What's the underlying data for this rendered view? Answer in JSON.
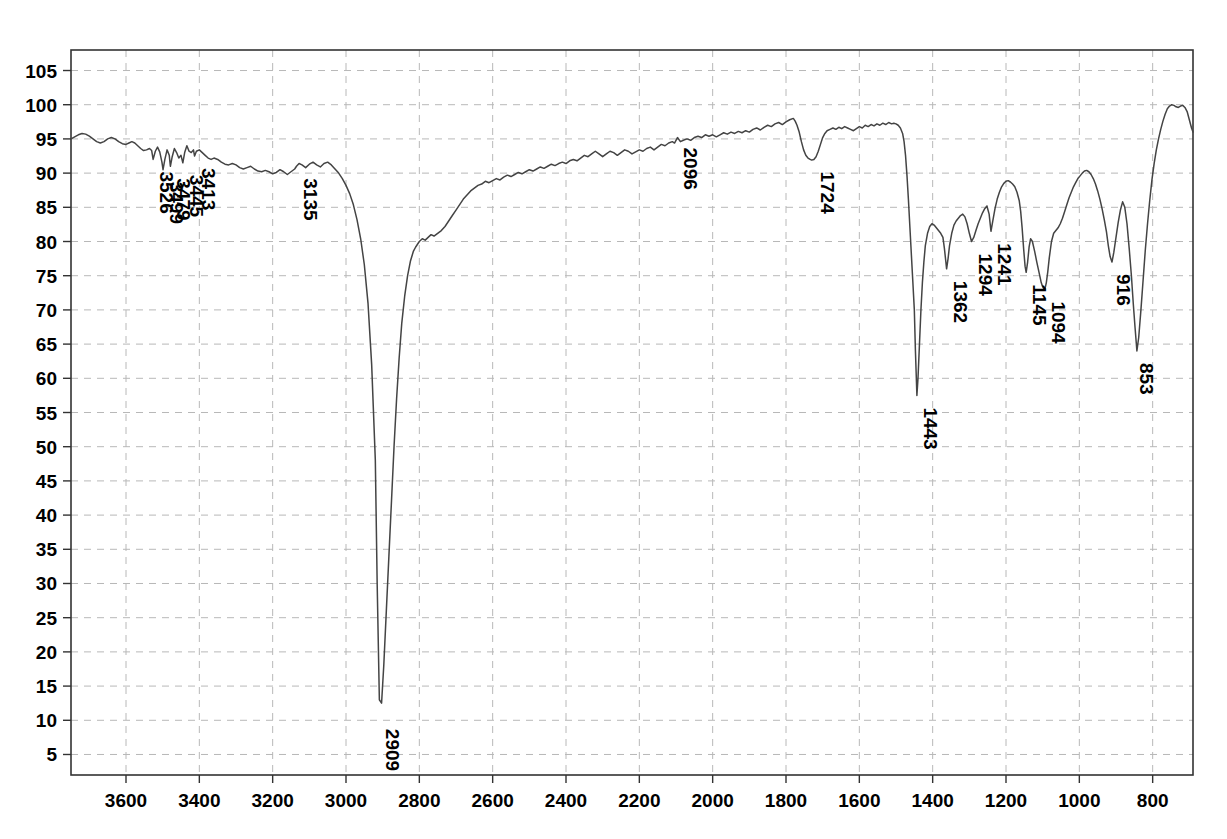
{
  "chart_data": {
    "type": "line",
    "title": "",
    "subtitle": "",
    "xlabel": "",
    "ylabel": "",
    "grid": true,
    "legend": "none",
    "x_axis": {
      "ticks": [
        3600,
        3400,
        3200,
        3000,
        2800,
        2600,
        2400,
        2200,
        2000,
        1800,
        1600,
        1400,
        1200,
        1000,
        800
      ],
      "min": 3750,
      "max": 690,
      "direction": "descending"
    },
    "y_axis": {
      "ticks": [
        5,
        10,
        15,
        20,
        25,
        30,
        35,
        40,
        45,
        50,
        55,
        60,
        65,
        70,
        75,
        80,
        85,
        90,
        95,
        100,
        105
      ],
      "min": 2,
      "max": 108
    },
    "line_color": "#444444",
    "grid_color": "#b8b8b8",
    "axis_color": "#333333",
    "annotations": [
      {
        "label": "3526",
        "x": 3526,
        "y": 92.0
      },
      {
        "label": "3499",
        "x": 3499,
        "y": 90.5
      },
      {
        "label": "3479",
        "x": 3479,
        "y": 91.0
      },
      {
        "label": "3445",
        "x": 3445,
        "y": 91.5
      },
      {
        "label": "3413",
        "x": 3413,
        "y": 92.5
      },
      {
        "label": "3135",
        "x": 3135,
        "y": 91.0
      },
      {
        "label": "2909",
        "x": 2909,
        "y": 10.5
      },
      {
        "label": "2096",
        "x": 2096,
        "y": 95.5
      },
      {
        "label": "1724",
        "x": 1724,
        "y": 92.0
      },
      {
        "label": "1443",
        "x": 1443,
        "y": 57.5
      },
      {
        "label": "1362",
        "x": 1362,
        "y": 76.0
      },
      {
        "label": "1294",
        "x": 1294,
        "y": 80.0
      },
      {
        "label": "1241",
        "x": 1241,
        "y": 81.5
      },
      {
        "label": "1145",
        "x": 1145,
        "y": 75.5
      },
      {
        "label": "1094",
        "x": 1094,
        "y": 73.0
      },
      {
        "label": "916",
        "x": 916,
        "y": 77.0
      },
      {
        "label": "853",
        "x": 853,
        "y": 64.0
      }
    ],
    "x": [
      3750,
      3740,
      3730,
      3720,
      3710,
      3700,
      3690,
      3680,
      3670,
      3660,
      3650,
      3640,
      3630,
      3620,
      3610,
      3600,
      3592,
      3584,
      3576,
      3568,
      3560,
      3552,
      3544,
      3536,
      3530,
      3526,
      3520,
      3514,
      3508,
      3502,
      3499,
      3494,
      3488,
      3482,
      3479,
      3474,
      3468,
      3462,
      3456,
      3450,
      3445,
      3440,
      3434,
      3428,
      3422,
      3416,
      3413,
      3408,
      3400,
      3392,
      3384,
      3376,
      3368,
      3360,
      3350,
      3340,
      3330,
      3320,
      3310,
      3300,
      3290,
      3280,
      3270,
      3260,
      3250,
      3240,
      3230,
      3220,
      3210,
      3200,
      3190,
      3180,
      3170,
      3160,
      3150,
      3140,
      3135,
      3128,
      3120,
      3110,
      3100,
      3090,
      3080,
      3070,
      3060,
      3050,
      3040,
      3030,
      3020,
      3010,
      3000,
      2990,
      2980,
      2970,
      2960,
      2950,
      2940,
      2930,
      2920,
      2915,
      2909,
      2903,
      2897,
      2890,
      2883,
      2876,
      2869,
      2862,
      2855,
      2848,
      2840,
      2832,
      2824,
      2816,
      2810,
      2805,
      2800,
      2792,
      2784,
      2776,
      2768,
      2760,
      2750,
      2740,
      2730,
      2720,
      2710,
      2700,
      2690,
      2680,
      2670,
      2660,
      2650,
      2640,
      2630,
      2620,
      2610,
      2600,
      2590,
      2580,
      2570,
      2560,
      2550,
      2540,
      2530,
      2520,
      2510,
      2500,
      2490,
      2480,
      2470,
      2460,
      2450,
      2440,
      2430,
      2420,
      2410,
      2400,
      2390,
      2380,
      2370,
      2360,
      2350,
      2340,
      2330,
      2320,
      2310,
      2300,
      2290,
      2280,
      2270,
      2260,
      2250,
      2240,
      2230,
      2220,
      2210,
      2200,
      2190,
      2180,
      2170,
      2160,
      2150,
      2140,
      2130,
      2120,
      2110,
      2104,
      2096,
      2088,
      2080,
      2070,
      2060,
      2050,
      2040,
      2030,
      2020,
      2010,
      2000,
      1990,
      1980,
      1970,
      1960,
      1950,
      1940,
      1930,
      1920,
      1910,
      1900,
      1890,
      1880,
      1870,
      1860,
      1850,
      1840,
      1830,
      1820,
      1810,
      1800,
      1790,
      1780,
      1775,
      1770,
      1764,
      1758,
      1752,
      1746,
      1740,
      1734,
      1730,
      1724,
      1718,
      1712,
      1706,
      1700,
      1694,
      1688,
      1680,
      1672,
      1664,
      1656,
      1648,
      1640,
      1632,
      1624,
      1616,
      1608,
      1600,
      1592,
      1584,
      1576,
      1568,
      1560,
      1552,
      1544,
      1536,
      1528,
      1520,
      1512,
      1506,
      1500,
      1494,
      1488,
      1482,
      1478,
      1474,
      1470,
      1466,
      1462,
      1458,
      1454,
      1450,
      1447,
      1443,
      1440,
      1436,
      1432,
      1428,
      1424,
      1420,
      1414,
      1408,
      1402,
      1396,
      1390,
      1384,
      1378,
      1372,
      1368,
      1364,
      1362,
      1358,
      1354,
      1348,
      1342,
      1336,
      1330,
      1324,
      1318,
      1312,
      1306,
      1300,
      1294,
      1288,
      1282,
      1276,
      1270,
      1264,
      1258,
      1252,
      1246,
      1241,
      1236,
      1230,
      1224,
      1218,
      1212,
      1206,
      1200,
      1194,
      1188,
      1182,
      1176,
      1170,
      1164,
      1160,
      1156,
      1152,
      1148,
      1145,
      1141,
      1137,
      1133,
      1128,
      1122,
      1116,
      1112,
      1108,
      1104,
      1100,
      1097,
      1094,
      1090,
      1086,
      1082,
      1076,
      1070,
      1064,
      1058,
      1052,
      1046,
      1040,
      1034,
      1028,
      1022,
      1016,
      1010,
      1004,
      998,
      992,
      986,
      980,
      974,
      968,
      962,
      956,
      950,
      944,
      938,
      932,
      926,
      921,
      916,
      911,
      906,
      900,
      894,
      888,
      882,
      876,
      870,
      864,
      858,
      853,
      848,
      843,
      838,
      832,
      826,
      820,
      814,
      808,
      802,
      796,
      790,
      784,
      778,
      772,
      766,
      760,
      754,
      748,
      742,
      736,
      730,
      724,
      718,
      712,
      706,
      700,
      694,
      690
    ],
    "y": [
      95.0,
      95.3,
      95.6,
      95.8,
      95.7,
      95.4,
      95.0,
      94.6,
      94.4,
      94.6,
      95.0,
      95.2,
      95.0,
      94.6,
      94.3,
      94.2,
      94.4,
      94.6,
      94.4,
      94.0,
      93.6,
      93.3,
      93.4,
      93.6,
      93.3,
      92.0,
      93.2,
      93.8,
      93.1,
      91.6,
      90.5,
      92.0,
      93.4,
      92.6,
      91.0,
      92.4,
      93.6,
      93.0,
      92.2,
      92.6,
      91.5,
      93.0,
      94.0,
      93.2,
      93.0,
      93.4,
      92.5,
      93.2,
      93.4,
      93.0,
      92.6,
      92.2,
      92.0,
      92.2,
      92.0,
      91.6,
      91.3,
      91.2,
      91.4,
      91.2,
      90.8,
      90.6,
      90.8,
      91.0,
      90.6,
      90.3,
      90.2,
      90.4,
      90.2,
      89.9,
      90.1,
      90.5,
      90.2,
      89.8,
      90.2,
      90.6,
      91.0,
      91.4,
      91.2,
      90.8,
      91.3,
      91.6,
      91.2,
      90.9,
      91.4,
      91.6,
      91.2,
      90.6,
      90.0,
      89.2,
      88.2,
      87.0,
      85.4,
      83.2,
      80.4,
      76.6,
      71.0,
      62.0,
      48.0,
      30.0,
      13.0,
      12.5,
      18.0,
      26.0,
      34.0,
      42.0,
      50.0,
      57.0,
      63.0,
      68.0,
      72.0,
      75.0,
      77.2,
      78.6,
      79.2,
      79.6,
      80.0,
      80.4,
      80.2,
      80.6,
      81.0,
      80.8,
      81.2,
      81.6,
      82.2,
      83.0,
      83.8,
      84.6,
      85.4,
      86.2,
      86.8,
      87.4,
      87.8,
      88.2,
      88.4,
      88.8,
      88.6,
      88.9,
      89.2,
      89.0,
      89.4,
      89.7,
      89.5,
      89.8,
      90.1,
      89.9,
      90.2,
      90.5,
      90.3,
      90.6,
      90.9,
      90.7,
      91.0,
      91.3,
      91.1,
      91.4,
      91.6,
      91.4,
      91.8,
      92.0,
      91.8,
      92.2,
      92.6,
      92.4,
      92.8,
      93.2,
      92.8,
      92.4,
      92.8,
      93.2,
      93.0,
      92.6,
      93.0,
      93.4,
      93.2,
      92.8,
      93.1,
      93.4,
      93.2,
      93.6,
      93.8,
      93.4,
      93.8,
      94.2,
      94.0,
      94.4,
      94.6,
      94.4,
      95.2,
      94.6,
      94.8,
      95.0,
      94.8,
      95.2,
      95.4,
      95.2,
      95.6,
      95.4,
      95.6,
      95.3,
      95.6,
      95.9,
      95.7,
      96.0,
      95.8,
      96.1,
      95.9,
      96.2,
      96.0,
      96.4,
      96.6,
      96.3,
      96.7,
      97.0,
      96.8,
      97.2,
      97.4,
      97.1,
      97.5,
      97.8,
      98.0,
      97.6,
      97.0,
      96.0,
      94.6,
      93.4,
      92.6,
      92.2,
      92.0,
      91.9,
      92.0,
      92.4,
      93.2,
      94.2,
      95.2,
      95.8,
      96.2,
      96.4,
      96.6,
      96.4,
      96.7,
      96.5,
      96.8,
      96.6,
      96.4,
      96.2,
      96.5,
      96.8,
      96.6,
      97.0,
      96.8,
      97.1,
      96.9,
      97.2,
      97.0,
      97.3,
      97.1,
      97.4,
      97.2,
      97.3,
      97.2,
      97.0,
      96.6,
      95.8,
      94.6,
      92.6,
      89.6,
      86.0,
      82.0,
      78.0,
      74.0,
      70.0,
      64.0,
      57.5,
      60.0,
      65.0,
      70.0,
      74.0,
      77.0,
      79.4,
      81.2,
      82.2,
      82.6,
      82.4,
      82.0,
      81.6,
      81.2,
      80.6,
      79.0,
      77.0,
      76.0,
      77.5,
      79.4,
      81.2,
      82.4,
      83.0,
      83.4,
      83.8,
      84.0,
      83.6,
      82.6,
      81.2,
      80.0,
      80.6,
      81.6,
      82.6,
      83.4,
      84.2,
      84.8,
      85.2,
      84.0,
      81.5,
      83.0,
      84.8,
      86.2,
      87.2,
      88.0,
      88.5,
      88.8,
      88.9,
      88.7,
      88.4,
      88.0,
      87.2,
      86.0,
      84.4,
      82.0,
      79.0,
      76.4,
      75.5,
      77.0,
      79.2,
      80.4,
      80.0,
      78.6,
      77.0,
      76.0,
      75.0,
      74.0,
      73.4,
      73.1,
      73.0,
      74.0,
      75.6,
      77.6,
      80.0,
      81.2,
      81.6,
      82.0,
      82.6,
      83.4,
      84.4,
      85.4,
      86.4,
      87.2,
      88.0,
      88.6,
      89.2,
      89.6,
      90.0,
      90.3,
      90.4,
      90.2,
      89.8,
      89.2,
      88.4,
      87.4,
      86.2,
      84.8,
      83.2,
      81.4,
      79.4,
      77.8,
      77.0,
      78.4,
      80.6,
      82.8,
      84.6,
      85.8,
      85.0,
      82.6,
      79.0,
      75.0,
      71.0,
      67.4,
      64.0,
      66.0,
      70.0,
      74.4,
      78.8,
      82.6,
      86.0,
      89.0,
      91.4,
      93.4,
      95.0,
      96.4,
      97.6,
      98.6,
      99.4,
      99.8,
      100.0,
      99.9,
      99.7,
      99.6,
      99.8,
      99.9,
      99.6,
      99.0,
      97.8,
      96.6,
      96.0,
      96.4,
      96.8
    ]
  }
}
